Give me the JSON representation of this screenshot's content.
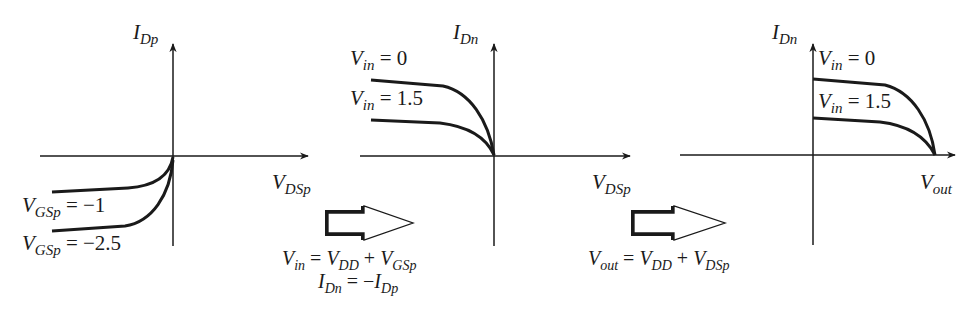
{
  "diagram": {
    "panels": [
      {
        "id": "pmos-characteristics",
        "y_axis": {
          "var": "I",
          "sub": "Dp"
        },
        "x_axis": {
          "var": "V",
          "sub": "DSp"
        },
        "curves": [
          {
            "var": "V",
            "sub": "GSp",
            "eq": " = ",
            "value": "−1"
          },
          {
            "var": "V",
            "sub": "GSp",
            "eq": " = ",
            "value": "−2.5"
          }
        ]
      },
      {
        "id": "mirrored-characteristics",
        "y_axis": {
          "var": "I",
          "sub": "Dn"
        },
        "x_axis": {
          "var": "V",
          "sub": "DSp"
        },
        "curves": [
          {
            "var": "V",
            "sub": "in",
            "eq": " = ",
            "value": "0"
          },
          {
            "var": "V",
            "sub": "in",
            "eq": " = ",
            "value": "1.5"
          }
        ]
      },
      {
        "id": "shifted-characteristics",
        "y_axis": {
          "var": "I",
          "sub": "Dn"
        },
        "x_axis": {
          "var": "V",
          "sub": "out"
        },
        "curves": [
          {
            "var": "V",
            "sub": "in",
            "eq": " = ",
            "value": "0"
          },
          {
            "var": "V",
            "sub": "in",
            "eq": " = ",
            "value": "1.5"
          }
        ]
      }
    ],
    "transforms": [
      {
        "arrow": "hollow-right-arrow",
        "lines": [
          {
            "lhs_var": "V",
            "lhs_sub": "in",
            "op1": " = ",
            "t1_var": "V",
            "t1_sub": "DD",
            "op2": " + ",
            "t2_var": "V",
            "t2_sub": "GSp"
          },
          {
            "lhs_var": "I",
            "lhs_sub": "Dn",
            "op1": " = −",
            "t1_var": "I",
            "t1_sub": "Dp"
          }
        ]
      },
      {
        "arrow": "hollow-right-arrow",
        "lines": [
          {
            "lhs_var": "V",
            "lhs_sub": "out",
            "op1": " = ",
            "t1_var": "V",
            "t1_sub": "DD",
            "op2": " + ",
            "t2_var": "V",
            "t2_sub": "DSp"
          }
        ]
      }
    ],
    "colors": {
      "ink": "#1a1a1a",
      "background": "#ffffff"
    }
  }
}
